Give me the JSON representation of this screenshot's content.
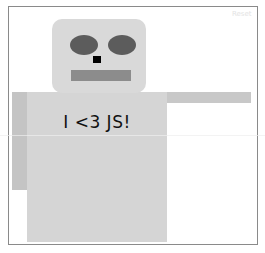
{
  "controls": {
    "reset_label": "Reset"
  },
  "robot": {
    "shirt_text": "I <3 JS!",
    "colors": {
      "head": "#d9d9d9",
      "eyes": "#5c5c5c",
      "nose": "#000000",
      "mouth": "#8c8c8c",
      "body": "#d5d5d5",
      "arm_left": "#c4c4c4",
      "arm_right": "#c8c8c8"
    }
  }
}
